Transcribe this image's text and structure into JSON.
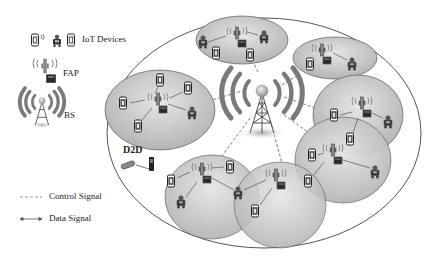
{
  "legend": {
    "iot_devices": "IoT Devices",
    "fap": "FAP",
    "bs": "BS",
    "control_signal": "Control Signal",
    "data_signal": "Data Signal"
  },
  "labels": {
    "d2d": "D2D"
  },
  "colors": {
    "cell_fill": "#c8c8c8",
    "cell_stroke": "#6a6a6a",
    "outer_stroke": "#555555",
    "bs_waves": "#7a7a7a",
    "bs_top": "#bbbbbb",
    "text": "#222222"
  },
  "diagram": {
    "macro_cell": {
      "cx": 264,
      "cy": 133,
      "rx": 157,
      "ry": 115
    },
    "base_station": {
      "x": 262,
      "y": 95
    },
    "femto_cells": [
      {
        "id": "top",
        "cx": 242,
        "cy": 40,
        "rx": 46,
        "ry": 24
      },
      {
        "id": "top-right",
        "cx": 335,
        "cy": 58,
        "rx": 42,
        "ry": 21
      },
      {
        "id": "left",
        "cx": 160,
        "cy": 110,
        "rx": 55,
        "ry": 40
      },
      {
        "id": "right",
        "cx": 358,
        "cy": 115,
        "rx": 45,
        "ry": 40
      },
      {
        "id": "bottom-left",
        "cx": 212,
        "cy": 197,
        "rx": 47,
        "ry": 42
      },
      {
        "id": "bottom-mid",
        "cx": 280,
        "cy": 205,
        "rx": 46,
        "ry": 43
      },
      {
        "id": "bottom-right",
        "cx": 343,
        "cy": 160,
        "rx": 48,
        "ry": 43
      }
    ]
  }
}
